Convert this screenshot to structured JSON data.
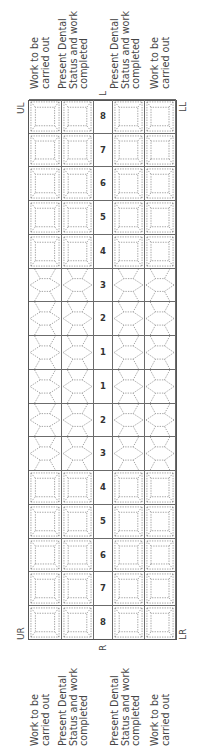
{
  "chart": {
    "title_hidden": "",
    "row_labels_left": [
      {
        "line1": "Work to be",
        "line2": "carried out"
      },
      {
        "line1": "Present Dental",
        "line2": "Status and work",
        "line3": "completed"
      },
      {
        "line1": "Present Dental",
        "line2": "Status and work",
        "line3": "completed"
      },
      {
        "line1": "Work to be",
        "line2": "carried out"
      }
    ],
    "row_labels_right": [
      {
        "line1": "Work to be",
        "line2": "carried out"
      },
      {
        "line1": "Present Dental",
        "line2": "Status and work",
        "line3": "completed"
      },
      {
        "line1": "Present Dental",
        "line2": "Status and work",
        "line3": "completed"
      },
      {
        "line1": "Work to be",
        "line2": "carried out"
      }
    ],
    "quadrants": {
      "upper_right": "UR",
      "upper_left": "UL",
      "lower_right": "LR",
      "lower_left": "LL"
    },
    "sides": {
      "right": "R",
      "left": "L"
    },
    "tooth_numbers": [
      "8",
      "7",
      "6",
      "5",
      "4",
      "3",
      "2",
      "1",
      "1",
      "2",
      "3",
      "4",
      "5",
      "6",
      "7",
      "8"
    ],
    "tooth_types": [
      "molar",
      "molar",
      "molar",
      "molar",
      "molar",
      "incisor",
      "incisor",
      "incisor",
      "incisor",
      "incisor",
      "incisor",
      "molar",
      "molar",
      "molar",
      "molar",
      "molar"
    ],
    "colors": {
      "grid": "#555555",
      "dotted": "#8a8a8a",
      "text": "#444444"
    }
  }
}
